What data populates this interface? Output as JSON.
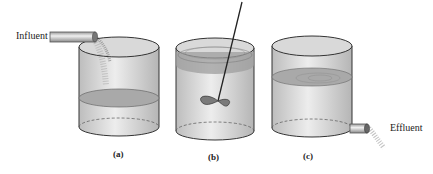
{
  "labels": {
    "influent": "Influent",
    "effluent": "Effluent"
  },
  "captions": {
    "a": "(a)",
    "b": "(b)",
    "c": "(c)"
  },
  "panels": [
    {
      "id": "a",
      "description": "Tank being filled with influent, liquid level low"
    },
    {
      "id": "b",
      "description": "Tank full, mixed by impeller"
    },
    {
      "id": "c",
      "description": "Tank draining effluent through bottom outlet pipe"
    }
  ]
}
